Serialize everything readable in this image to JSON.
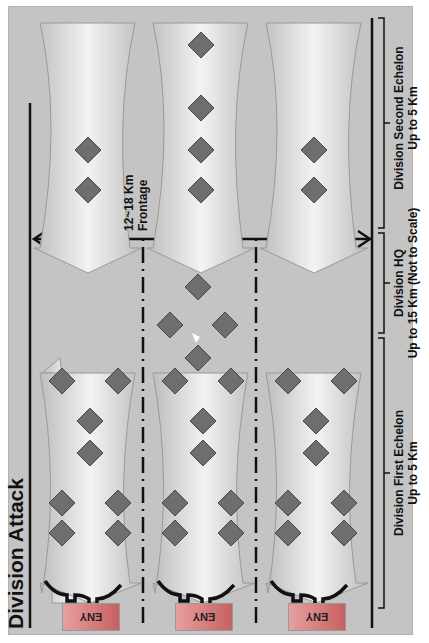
{
  "title": "Division Attack",
  "frontage": {
    "line1": "12~18 Km",
    "line2": "Frontage"
  },
  "sections": [
    {
      "name": "Division First Echelon",
      "range": "Up to 5 Km"
    },
    {
      "name": "Division HQ",
      "range": "Up to 15 Km (Not to Scale)"
    },
    {
      "name": "Division Second Echelon",
      "range": "Up to 5 Km"
    }
  ],
  "enemy_label": "ENY",
  "enemy_positions": [
    "ENY",
    "ENY",
    "ENY"
  ],
  "first_echelon_units": {
    "row_a": [
      {
        "echelon": "I",
        "type": "T80"
      },
      {
        "echelon": "II",
        "type": "BMP"
      }
    ],
    "center": [
      {
        "echelon": "III",
        "type": "BMP"
      },
      {
        "echelon": "I",
        "type": "T80"
      }
    ],
    "row_b": [
      {
        "echelon": "I",
        "type": "T80"
      },
      {
        "echelon": "II",
        "type": "BMP"
      }
    ],
    "rear": [
      {
        "echelon": "II",
        "type": "CSS"
      },
      {
        "echelon": "II",
        "type": "BM21"
      }
    ]
  },
  "hq_units": [
    {
      "echelon": "XX",
      "type": "Division HQ"
    },
    {
      "echelon": "III",
      "type": "9A52"
    },
    {
      "echelon": "II",
      "type": "CSS"
    },
    {
      "echelon": "III",
      "type": "SA21"
    }
  ],
  "second_echelon_units": {
    "row_1": [
      {
        "echelon": "I",
        "type": "T80"
      },
      {
        "echelon": "II",
        "type": "BTR"
      }
    ],
    "row_2": [
      {
        "echelon": "I",
        "type": "T80"
      },
      {
        "echelon": "III",
        "type": "BTR"
      },
      {
        "echelon": "II",
        "type": "2A18"
      },
      {
        "echelon": "II",
        "type": "CSS"
      }
    ],
    "row_3": [
      {
        "echelon": "I",
        "type": "T80"
      },
      {
        "echelon": "II",
        "type": "BTR"
      }
    ]
  },
  "colors": {
    "background": "#c4c4c4",
    "unit_fill": "#6e6e6e",
    "arrow_fill": "#e8e8e8",
    "eny_fill": "#d88080"
  }
}
